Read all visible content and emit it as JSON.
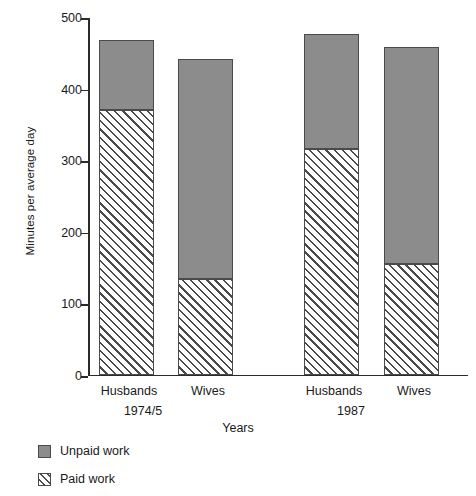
{
  "chart_data": {
    "type": "bar",
    "subtype": "stacked",
    "title": "",
    "xlabel": "Years",
    "ylabel": "Minutes per average day",
    "ylim": [
      0,
      500
    ],
    "yticks": [
      0,
      100,
      200,
      300,
      400,
      500
    ],
    "grid": false,
    "legend_position": "bottom-left",
    "groups": [
      {
        "label": "1974/5",
        "categories": [
          "Husbands",
          "Wives"
        ]
      },
      {
        "label": "1987",
        "categories": [
          "Husbands",
          "Wives"
        ]
      }
    ],
    "categories": [
      "Husbands",
      "Wives",
      "Husbands",
      "Wives"
    ],
    "series": [
      {
        "name": "Paid work",
        "fill": "hatched",
        "color": "#ffffff",
        "values": [
          370,
          133,
          315,
          155
        ]
      },
      {
        "name": "Unpaid work",
        "fill": "solid",
        "color": "#8c8c8c",
        "values": [
          97,
          307,
          160,
          303
        ]
      }
    ],
    "totals": [
      467,
      440,
      475,
      458
    ],
    "bars": [
      {
        "category": "Husbands",
        "group": "1974/5",
        "paid": 370,
        "unpaid": 97,
        "total": 467
      },
      {
        "category": "Wives",
        "group": "1974/5",
        "paid": 133,
        "unpaid": 307,
        "total": 440
      },
      {
        "category": "Husbands",
        "group": "1987",
        "paid": 315,
        "unpaid": 160,
        "total": 475
      },
      {
        "category": "Wives",
        "group": "1987",
        "paid": 155,
        "unpaid": 303,
        "total": 458
      }
    ]
  },
  "axis": {
    "y_title": "Minutes per average day",
    "x_title": "Years",
    "y_tick_labels": [
      "0",
      "100",
      "200",
      "300",
      "400",
      "500"
    ]
  },
  "category_labels": [
    "Husbands",
    "Wives",
    "Husbands",
    "Wives"
  ],
  "group_labels": [
    "1974/5",
    "1987"
  ],
  "legend": {
    "items": [
      {
        "label": "Unpaid work",
        "swatch": "solid-gray-square"
      },
      {
        "label": "Paid work",
        "swatch": "hatched-square"
      }
    ]
  },
  "colors": {
    "unpaid": "#8c8c8c",
    "paid": "#ffffff",
    "outline": "#4a4a4a",
    "axis": "#2b2b2b",
    "text": "#1a1a1a",
    "background": "#ffffff"
  }
}
